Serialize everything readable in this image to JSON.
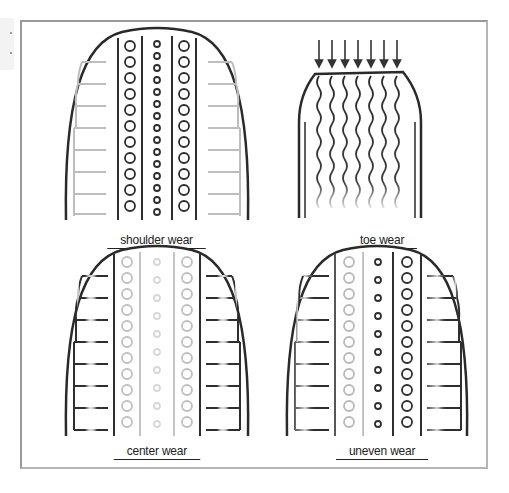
{
  "figure": {
    "panels": [
      {
        "id": "shoulder",
        "label": "shoulder wear",
        "worn_region": "shoulders"
      },
      {
        "id": "toe",
        "label": "toe wear",
        "worn_region": "tread edge (feathered)"
      },
      {
        "id": "center",
        "label": "center wear",
        "worn_region": "center"
      },
      {
        "id": "uneven",
        "label": "uneven wear",
        "worn_region": "one side"
      }
    ],
    "arrows_count": 7
  },
  "colors": {
    "outline": "#2a2a2a",
    "worn": "#c8c8c8",
    "frame": "#9a9a9a"
  }
}
